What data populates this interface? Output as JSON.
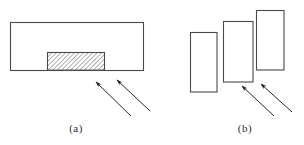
{
  "figure": {
    "kind": "engineering-line-diagram",
    "width": 304,
    "height": 145,
    "background_color": "#ffffff",
    "stroke_color": "#4a4a4a",
    "hatch_color": "#555555",
    "arrow_color": "#1a1a1a",
    "panel_count": 2
  },
  "panels": [
    {
      "id": "a",
      "caption": "(a)",
      "description": "single rectangular block with hatched zone on lower face",
      "outer_block": {
        "x": 10,
        "y": 22,
        "width": 133,
        "height": 48,
        "fill": "#ffffff",
        "stroke_width": 1
      },
      "hatched_region": {
        "x": 47,
        "y": 52,
        "width": 57,
        "height": 18,
        "pattern": "diagonal-hatch-45",
        "pattern_spacing": 3,
        "stroke_width": 1
      },
      "arrows": [
        {
          "name": "arrow-left",
          "x1": 131,
          "y1": 116,
          "x2": 94,
          "y2": 81
        },
        {
          "name": "arrow-right",
          "x1": 150,
          "y1": 111,
          "x2": 115,
          "y2": 79
        }
      ]
    },
    {
      "id": "b",
      "caption": "(b)",
      "description": "three overlapping rectangles in ascending staircase arrangement",
      "rectangles": [
        {
          "name": "rect-left",
          "x": 190,
          "y": 32,
          "width": 27,
          "height": 60,
          "fill": "#ffffff",
          "stroke_width": 1
        },
        {
          "name": "rect-middle",
          "x": 223,
          "y": 21,
          "width": 30,
          "height": 61,
          "fill": "#ffffff",
          "stroke_width": 1
        },
        {
          "name": "rect-right",
          "x": 256,
          "y": 10,
          "width": 28,
          "height": 60,
          "fill": "#ffffff",
          "stroke_width": 1
        }
      ],
      "arrows": [
        {
          "name": "arrow-left",
          "x1": 274,
          "y1": 116,
          "x2": 240,
          "y2": 85
        },
        {
          "name": "arrow-right",
          "x1": 292,
          "y1": 112,
          "x2": 259,
          "y2": 83
        }
      ]
    }
  ]
}
